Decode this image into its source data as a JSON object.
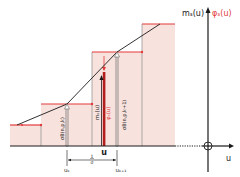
{
  "colors": {
    "step_fill": "#f8e2de",
    "step_line": "#e23b3b",
    "curve": "#1a1a1a",
    "axis": "#1a1a1a",
    "guide": "#8a8a8a",
    "red_label": "#e23b3b",
    "bar": "#b01e1e"
  },
  "axis_labels": {
    "y_black": "mₛ(u)",
    "y_red": "φₛ(u)",
    "x": "u"
  },
  "inner_labels": {
    "bar_black": "mₛ(u)",
    "bar_red": "φₛ(u)",
    "bar_x": "u",
    "left_arrow": "σB(n,p,k)",
    "right_arrow": "σB(n,p,k+1)",
    "u_k": "uₖ",
    "u_k1": "uₖ₊₁",
    "spacing_num": "1",
    "spacing_den": "σ"
  }
}
